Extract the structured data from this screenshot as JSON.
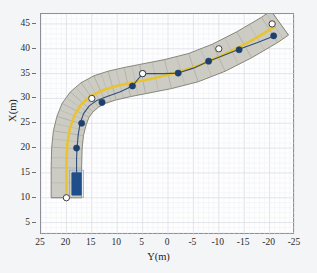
{
  "figure": {
    "background_color": "#f4f5f7",
    "plot_background_color": "#fefeff",
    "axes_border_color": "#8d9099"
  },
  "chart_data": {
    "type": "line",
    "title": "",
    "subtitle": "",
    "xlabel": "Y(m)",
    "ylabel": "X(m)",
    "xlim": [
      25,
      -25
    ],
    "ylim": [
      2.5,
      47
    ],
    "x_inverted": true,
    "xticks": [
      25,
      20,
      15,
      10,
      5,
      0,
      -5,
      -10,
      -15,
      -20,
      -25
    ],
    "xtick_labels": [
      "25",
      "20",
      "15",
      "10",
      "5",
      "0",
      "-5",
      "-10",
      "-15",
      "-20",
      "-25"
    ],
    "yticks": [
      5,
      10,
      15,
      20,
      25,
      30,
      35,
      40,
      45
    ],
    "ytick_labels": [
      "5",
      "10",
      "15",
      "20",
      "25",
      "30",
      "35",
      "40",
      "45"
    ],
    "grid": true,
    "grid_minor": true,
    "legend": null,
    "legend_position": "none",
    "annotations": [],
    "series": [
      {
        "name": "road-corridor",
        "role": "drivable-area-band",
        "type": "band",
        "fill_color": "#c9c9c1",
        "edge_color": "#6e6e60",
        "hatch": "perpendicular-ribs",
        "half_width_m": 3.0,
        "centerline": [
          {
            "y": 20.0,
            "x": 10.0
          },
          {
            "y": 20.0,
            "x": 16.0
          },
          {
            "y": 19.9,
            "x": 20.0
          },
          {
            "y": 19.6,
            "x": 23.0
          },
          {
            "y": 19.0,
            "x": 25.5
          },
          {
            "y": 18.2,
            "x": 27.6
          },
          {
            "y": 17.0,
            "x": 29.3
          },
          {
            "y": 15.4,
            "x": 30.7
          },
          {
            "y": 13.4,
            "x": 31.8
          },
          {
            "y": 11.0,
            "x": 32.6
          },
          {
            "y": 8.0,
            "x": 33.3
          },
          {
            "y": 5.0,
            "x": 33.9
          },
          {
            "y": 0.0,
            "x": 34.9
          },
          {
            "y": -5.0,
            "x": 36.2
          },
          {
            "y": -10.0,
            "x": 38.2
          },
          {
            "y": -15.0,
            "x": 40.8
          },
          {
            "y": -20.0,
            "x": 43.8
          },
          {
            "y": -22.0,
            "x": 45.2
          }
        ]
      },
      {
        "name": "reference-path",
        "role": "yellow-center-reference",
        "type": "line",
        "color": "#e8c432",
        "linewidth": 2.6,
        "points": [
          {
            "y": 20.0,
            "x": 10.0
          },
          {
            "y": 20.0,
            "x": 17.0
          },
          {
            "y": 19.8,
            "x": 21.0
          },
          {
            "y": 19.3,
            "x": 24.0
          },
          {
            "y": 18.4,
            "x": 26.6
          },
          {
            "y": 17.1,
            "x": 28.8
          },
          {
            "y": 15.3,
            "x": 30.4
          },
          {
            "y": 13.0,
            "x": 31.6
          },
          {
            "y": 10.2,
            "x": 32.5
          },
          {
            "y": 7.0,
            "x": 33.2
          },
          {
            "y": 3.0,
            "x": 34.0
          },
          {
            "y": -1.0,
            "x": 35.0
          },
          {
            "y": -6.0,
            "x": 36.6
          },
          {
            "y": -11.0,
            "x": 38.8
          },
          {
            "y": -16.0,
            "x": 41.4
          },
          {
            "y": -21.0,
            "x": 44.4
          }
        ]
      },
      {
        "name": "reference-waypoints",
        "role": "white-circle-markers",
        "type": "scatter",
        "marker": "o",
        "face_color": "#ffffff",
        "edge_color": "#2d2d2d",
        "size": 5.5,
        "points": [
          {
            "y": 20.0,
            "x": 10.0
          },
          {
            "y": 15.0,
            "x": 30.0
          },
          {
            "y": 5.0,
            "x": 35.0
          },
          {
            "y": -10.0,
            "x": 40.0
          },
          {
            "y": -20.5,
            "x": 45.0
          }
        ]
      },
      {
        "name": "vehicle-trajectory",
        "role": "tracked-path",
        "type": "line",
        "color": "#2f4f7a",
        "linewidth": 1.1,
        "points": [
          {
            "y": 18.0,
            "x": 14.0
          },
          {
            "y": 18.0,
            "x": 18.0
          },
          {
            "y": 17.9,
            "x": 20.0
          },
          {
            "y": 17.7,
            "x": 22.5
          },
          {
            "y": 17.3,
            "x": 25.0
          },
          {
            "y": 16.6,
            "x": 27.0
          },
          {
            "y": 15.5,
            "x": 28.5
          },
          {
            "y": 14.0,
            "x": 29.6
          },
          {
            "y": 12.0,
            "x": 30.4
          },
          {
            "y": 9.5,
            "x": 31.3
          },
          {
            "y": 7.0,
            "x": 32.5
          },
          {
            "y": 5.0,
            "x": 35.0
          },
          {
            "y": 1.0,
            "x": 35.0
          },
          {
            "y": -2.0,
            "x": 35.1
          },
          {
            "y": -5.0,
            "x": 36.1
          },
          {
            "y": -8.0,
            "x": 37.5
          },
          {
            "y": -11.0,
            "x": 38.7
          },
          {
            "y": -14.0,
            "x": 39.9
          },
          {
            "y": -17.5,
            "x": 41.2
          },
          {
            "y": -21.0,
            "x": 42.6
          }
        ]
      },
      {
        "name": "trajectory-samples",
        "role": "navy-dot-markers",
        "type": "scatter",
        "marker": "o",
        "face_color": "#1f3f6e",
        "edge_color": "#1f3f6e",
        "size": 5.0,
        "points": [
          {
            "y": 18.0,
            "x": 20.0
          },
          {
            "y": 17.0,
            "x": 25.0
          },
          {
            "y": 13.0,
            "x": 29.2
          },
          {
            "y": 7.0,
            "x": 32.5
          },
          {
            "y": 5.0,
            "x": 35.0
          },
          {
            "y": -2.0,
            "x": 35.1
          },
          {
            "y": -8.0,
            "x": 37.5
          },
          {
            "y": -14.0,
            "x": 39.8
          },
          {
            "y": -20.8,
            "x": 42.6
          }
        ]
      },
      {
        "name": "vehicle-body",
        "role": "ego-vehicle-rectangle",
        "type": "rect",
        "fill_color": "#1f4e8c",
        "edge_color": "#7fa8cf",
        "center": {
          "y": 18.0,
          "x": 12.8
        },
        "length_m": 4.6,
        "width_m": 1.9
      }
    ]
  }
}
